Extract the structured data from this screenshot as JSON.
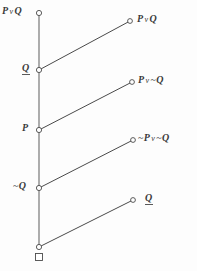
{
  "diagram": {
    "type": "logic-lattice",
    "colors": {
      "line": "#4a4a4a",
      "node_stroke": "#4a4a4a",
      "node_fill": "#ffffff",
      "text": "#3a3a3a",
      "background": "#fdfdfd"
    },
    "spine": {
      "x": 39,
      "top_y": 13,
      "bottom_y": 247,
      "nodes": [
        {
          "id": "spine-top",
          "label": "P v Q",
          "underlined": false,
          "x": 39,
          "y": 13,
          "label_x": 3,
          "label_y": 7
        },
        {
          "id": "spine-q",
          "label": "Q",
          "underlined": true,
          "x": 39,
          "y": 70,
          "label_x": 22,
          "label_y": 64
        },
        {
          "id": "spine-p",
          "label": "P",
          "underlined": false,
          "x": 39,
          "y": 130,
          "label_x": 22,
          "label_y": 124
        },
        {
          "id": "spine-not-q",
          "label": "~Q",
          "underlined": false,
          "x": 39,
          "y": 188,
          "label_x": 14,
          "label_y": 182
        },
        {
          "id": "spine-bottom",
          "label": "",
          "underlined": false,
          "x": 39,
          "y": 247,
          "label_x": 0,
          "label_y": 0
        }
      ]
    },
    "terminal": {
      "shape": "open-square",
      "x": 39,
      "y": 257,
      "size": 7
    },
    "branches": [
      {
        "id": "branch-1",
        "label": "P v Q",
        "underlined": false,
        "from_x": 39,
        "from_y": 70,
        "to_x": 130,
        "to_y": 21,
        "label_x": 137,
        "label_y": 15
      },
      {
        "id": "branch-2",
        "label": "P v ~Q",
        "underlined": false,
        "from_x": 39,
        "from_y": 130,
        "to_x": 132,
        "to_y": 82,
        "label_x": 139,
        "label_y": 76
      },
      {
        "id": "branch-3",
        "label": "~P v ~Q",
        "underlined": false,
        "from_x": 39,
        "from_y": 188,
        "to_x": 133,
        "to_y": 140,
        "label_x": 139,
        "label_y": 134
      },
      {
        "id": "branch-4",
        "label": "Q",
        "underlined": true,
        "from_x": 39,
        "from_y": 247,
        "to_x": 133,
        "to_y": 200,
        "label_x": 145,
        "label_y": 194
      }
    ]
  },
  "labels": {
    "spine_top": {
      "operand_left": "P",
      "connective": "v",
      "operand_right": "Q"
    },
    "spine_q": {
      "text": "Q"
    },
    "spine_p": {
      "text": "P"
    },
    "spine_not_q": {
      "negation": "~",
      "text": "Q"
    },
    "branch_1": {
      "operand_left": "P",
      "connective": "v",
      "operand_right": "Q"
    },
    "branch_2": {
      "operand_left": "P",
      "connective": "v",
      "negation": "~",
      "operand_right": "Q"
    },
    "branch_3": {
      "negation_left": "~",
      "operand_left": "P",
      "connective": "v",
      "negation_right": "~",
      "operand_right": "Q"
    },
    "branch_4": {
      "text": "Q"
    }
  }
}
